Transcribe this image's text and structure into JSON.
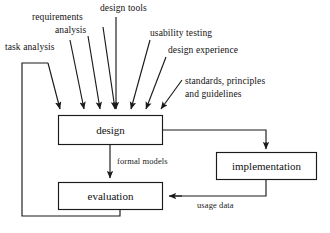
{
  "diagram": {
    "type": "process-flow",
    "stroke_color": "#1a1a1a",
    "background_color": "#ffffff",
    "boxes": [
      {
        "id": "design",
        "label": "design",
        "x": 58,
        "y": 115,
        "w": 105,
        "h": 30
      },
      {
        "id": "implementation",
        "label": "implementation",
        "x": 216,
        "y": 152,
        "w": 101,
        "h": 28
      },
      {
        "id": "evaluation",
        "label": "evaluation",
        "x": 58,
        "y": 182,
        "w": 105,
        "h": 28
      }
    ],
    "input_labels": [
      {
        "id": "task-analysis",
        "text": "task analysis",
        "x": 5,
        "y": 42,
        "align": "left"
      },
      {
        "id": "requirements",
        "text": "requirements",
        "x": 32,
        "y": 12,
        "align": "left"
      },
      {
        "id": "analysis",
        "text": "analysis",
        "x": 55,
        "y": 25,
        "align": "left"
      },
      {
        "id": "design-tools",
        "text": "design tools",
        "x": 100,
        "y": 3,
        "align": "left"
      },
      {
        "id": "usability-testing",
        "text": "usability testing",
        "x": 150,
        "y": 28,
        "align": "left"
      },
      {
        "id": "design-experience",
        "text": "design experience",
        "x": 168,
        "y": 45,
        "align": "left"
      },
      {
        "id": "standards-principles",
        "text": "standards, principles",
        "x": 185,
        "y": 76,
        "align": "left"
      },
      {
        "id": "and-guidelines",
        "text": "and guidelines",
        "x": 185,
        "y": 89,
        "align": "left"
      }
    ],
    "edge_labels": [
      {
        "id": "formal-models",
        "text": "formal models",
        "x": 117,
        "y": 156
      },
      {
        "id": "usage-data",
        "text": "usage data",
        "x": 197,
        "y": 200
      }
    ],
    "connections": [
      {
        "from": "design",
        "to": "implementation",
        "label": ""
      },
      {
        "from": "design",
        "to": "evaluation",
        "label": "formal models"
      },
      {
        "from": "implementation",
        "to": "evaluation",
        "label": "usage data"
      },
      {
        "from": "evaluation",
        "to": "design",
        "label": ""
      }
    ]
  }
}
